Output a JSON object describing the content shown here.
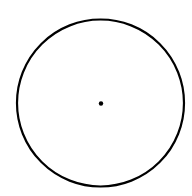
{
  "diagram": {
    "type": "circle-with-center-point",
    "background": "#ffffff",
    "stroke_color": "#000000",
    "circle": {
      "cx": 100.5,
      "cy": 103,
      "r": 83.5,
      "stroke_width": 2.2
    },
    "center_point": {
      "cx": 101,
      "cy": 103.5,
      "r": 2.2
    }
  }
}
